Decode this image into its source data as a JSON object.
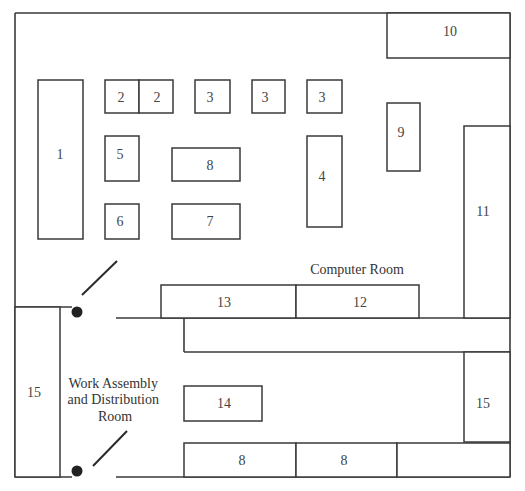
{
  "diagram": {
    "type": "floor-plan",
    "colors": {
      "line": "#3a3a3a",
      "background": "#ffffff",
      "text": "#444444"
    },
    "rooms": [
      {
        "id": "computer-room",
        "label": "Computer Room"
      },
      {
        "id": "work-assembly",
        "label_lines": [
          "Work Assembly",
          "and Distribution",
          "Room"
        ]
      }
    ],
    "stations": [
      {
        "id": "s1",
        "label": "1"
      },
      {
        "id": "s2a",
        "label": "2"
      },
      {
        "id": "s2b",
        "label": "2"
      },
      {
        "id": "s3a",
        "label": "3"
      },
      {
        "id": "s3b",
        "label": "3"
      },
      {
        "id": "s3c",
        "label": "3"
      },
      {
        "id": "s4",
        "label": "4"
      },
      {
        "id": "s5",
        "label": "5"
      },
      {
        "id": "s6",
        "label": "6"
      },
      {
        "id": "s7",
        "label": "7"
      },
      {
        "id": "s8top",
        "label": "8"
      },
      {
        "id": "s9",
        "label": "9"
      },
      {
        "id": "s10",
        "label": "10"
      },
      {
        "id": "s11",
        "label": "11"
      },
      {
        "id": "s12",
        "label": "12"
      },
      {
        "id": "s13",
        "label": "13"
      },
      {
        "id": "s14",
        "label": "14"
      },
      {
        "id": "s15left",
        "label": "15"
      },
      {
        "id": "s15right",
        "label": "15"
      },
      {
        "id": "s8bota",
        "label": "8"
      },
      {
        "id": "s8botb",
        "label": "8"
      }
    ],
    "doors": [
      {
        "id": "door-upper"
      },
      {
        "id": "door-lower"
      }
    ]
  }
}
